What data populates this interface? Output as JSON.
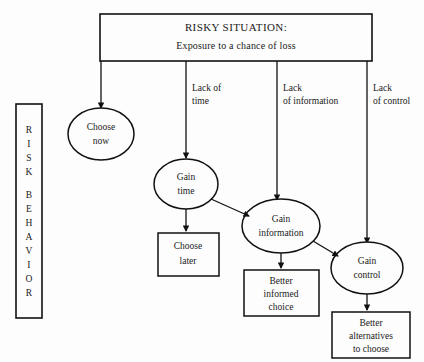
{
  "diagram": {
    "background_color": "#fdfdfd",
    "line_color": "#111111",
    "text_color": "#1a1a1a"
  },
  "sidebar": {
    "label_full": "RISK BEHAVIOR",
    "line1": "RISK",
    "line2": "BEHAVIOR",
    "letters": [
      "R",
      "I",
      "S",
      "K",
      "B",
      "E",
      "H",
      "A",
      "V",
      "I",
      "O",
      "R"
    ]
  },
  "header": {
    "title": "RISKY SITUATION:",
    "subtitle": "Exposure to a chance of loss"
  },
  "edge_labels": [
    {
      "id": "edge-lack-of-time",
      "line1": "Lack of",
      "line2": "time"
    },
    {
      "id": "edge-lack-of-information",
      "line1": "Lack",
      "line2": "of information"
    },
    {
      "id": "edge-lack-of-control",
      "line1": "Lack",
      "line2": "of control"
    }
  ],
  "ellipses": [
    {
      "id": "choose-now",
      "line1": "Choose",
      "line2": "now"
    },
    {
      "id": "gain-time",
      "line1": "Gain",
      "line2": "time"
    },
    {
      "id": "gain-information",
      "line1": "Gain",
      "line2": "information"
    },
    {
      "id": "gain-control",
      "line1": "Gain",
      "line2": "control"
    }
  ],
  "outcomes": [
    {
      "id": "choose-later",
      "line1": "Choose",
      "line2": "later",
      "line3": ""
    },
    {
      "id": "better-informed-choice",
      "line1": "Better",
      "line2": "informed",
      "line3": "choice"
    },
    {
      "id": "better-alternatives",
      "line1": "Better",
      "line2": "alternatives",
      "line3": "to choose"
    }
  ]
}
